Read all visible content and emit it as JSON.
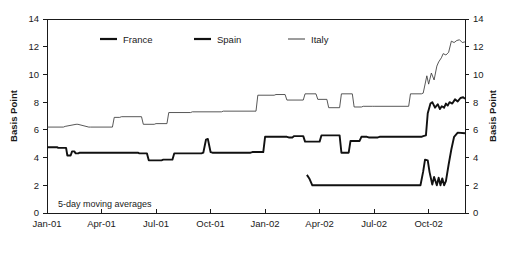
{
  "chart_data": {
    "type": "line",
    "title": "",
    "xlabel": "",
    "ylabel": "Basis Point",
    "ylabel_right": "Basis Point",
    "ylim": [
      0,
      14
    ],
    "yticks": [
      0,
      2,
      4,
      6,
      8,
      10,
      12,
      14
    ],
    "ytick_labels": [
      "0",
      "2",
      "4",
      "6",
      "8",
      "10",
      "12",
      "14"
    ],
    "xtick_labels": [
      "Jan-01",
      "Apr-01",
      "Jul-01",
      "Oct-01",
      "Jan-02",
      "Apr-02",
      "Jul-02",
      "Oct-02"
    ],
    "xtick_positions": [
      0,
      3,
      6,
      9,
      12,
      15,
      18,
      21
    ],
    "xlim": [
      0,
      23
    ],
    "grid": false,
    "legend_position": "top-center",
    "annotation": "5-day moving averages",
    "legend": [
      {
        "name": "France",
        "style": "thick",
        "color": "#111111"
      },
      {
        "name": "Spain",
        "style": "thick",
        "color": "#111111"
      },
      {
        "name": "Italy",
        "style": "thin",
        "color": "#3a3a3a"
      }
    ],
    "series": [
      {
        "name": "France",
        "style": "thick",
        "color": "#111111",
        "x": [
          0,
          0.55,
          0.62,
          1.05,
          1.12,
          1.3,
          1.38,
          1.5,
          1.58,
          1.72,
          1.8,
          5.0,
          5.08,
          5.5,
          5.6,
          6.3,
          6.4,
          6.9,
          7.0,
          8.5,
          8.6,
          8.75,
          8.85,
          9.0,
          9.1,
          11.2,
          11.3,
          11.9,
          12.0,
          13.2,
          13.3,
          13.5,
          13.6,
          14.1,
          14.2,
          15.0,
          15.1,
          16.1,
          16.2,
          16.6,
          16.7,
          17.2,
          17.3,
          17.6,
          17.7,
          18.2,
          18.3,
          20.6,
          20.7,
          20.85,
          20.95,
          21.1,
          21.2,
          21.35,
          21.5,
          21.62,
          21.72,
          21.85,
          21.95,
          22.05,
          22.15,
          22.3,
          22.45,
          22.6,
          22.75,
          22.9,
          23
        ],
        "y": [
          4.75,
          4.75,
          4.7,
          4.7,
          4.15,
          4.15,
          4.45,
          4.45,
          4.3,
          4.3,
          4.35,
          4.35,
          4.3,
          4.3,
          3.8,
          3.8,
          3.85,
          3.85,
          4.3,
          4.3,
          4.35,
          5.3,
          5.35,
          4.4,
          4.35,
          4.35,
          4.4,
          4.4,
          5.5,
          5.5,
          5.45,
          5.45,
          5.55,
          5.55,
          5.15,
          5.15,
          5.6,
          5.6,
          4.35,
          4.35,
          5.2,
          5.2,
          5.5,
          5.5,
          5.45,
          5.45,
          5.5,
          5.5,
          5.55,
          5.6,
          7.2,
          7.9,
          8.0,
          7.6,
          7.85,
          7.5,
          7.7,
          7.6,
          7.9,
          7.75,
          8.0,
          7.9,
          8.2,
          8.05,
          8.3,
          8.35,
          8.25
        ]
      },
      {
        "name": "Spain",
        "style": "thick",
        "color": "#111111",
        "x": [
          14.3,
          14.45,
          14.6,
          20.45,
          20.55,
          20.7,
          20.8,
          20.95,
          21.05,
          21.2,
          21.3,
          21.45,
          21.55,
          21.65,
          21.75,
          21.85,
          21.95,
          22.1,
          22.25,
          22.4,
          22.6,
          23
        ],
        "y": [
          2.75,
          2.45,
          2.0,
          2.0,
          2.0,
          3.0,
          3.85,
          3.8,
          2.95,
          2.05,
          2.6,
          2.0,
          2.55,
          2.0,
          2.5,
          2.0,
          2.3,
          3.5,
          4.6,
          5.5,
          5.8,
          5.75
        ]
      },
      {
        "name": "Italy",
        "style": "thin",
        "color": "#3a3a3a",
        "x": [
          0,
          0.9,
          1.0,
          1.6,
          1.7,
          2.3,
          2.4,
          3.6,
          3.7,
          4.0,
          4.1,
          5.2,
          5.3,
          5.9,
          6.0,
          6.6,
          6.7,
          7.9,
          8.0,
          9.6,
          9.7,
          11.5,
          11.6,
          12.5,
          12.6,
          13.1,
          13.2,
          14.1,
          14.2,
          14.8,
          14.9,
          15.4,
          15.5,
          16.1,
          16.2,
          16.8,
          16.9,
          17.3,
          17.4,
          17.9,
          18.0,
          19.9,
          20.0,
          20.6,
          20.7,
          20.9,
          21.0,
          21.15,
          21.3,
          21.45,
          21.55,
          21.7,
          21.8,
          21.95,
          22.1,
          22.25,
          22.4,
          22.55,
          22.7,
          22.85,
          23
        ],
        "y": [
          6.2,
          6.2,
          6.25,
          6.4,
          6.4,
          6.2,
          6.2,
          6.2,
          6.9,
          6.9,
          6.95,
          6.95,
          6.4,
          6.4,
          6.45,
          6.45,
          7.25,
          7.25,
          7.3,
          7.3,
          7.35,
          7.35,
          8.5,
          8.5,
          8.55,
          8.55,
          8.15,
          8.15,
          8.6,
          8.6,
          8.2,
          8.2,
          7.6,
          7.6,
          8.6,
          8.6,
          7.65,
          7.65,
          7.7,
          7.7,
          7.7,
          7.7,
          8.6,
          8.6,
          8.65,
          9.9,
          9.3,
          10.1,
          9.6,
          10.6,
          10.9,
          11.2,
          11.5,
          11.4,
          11.6,
          12.4,
          12.3,
          12.45,
          12.5,
          12.3,
          12.35
        ]
      }
    ]
  }
}
